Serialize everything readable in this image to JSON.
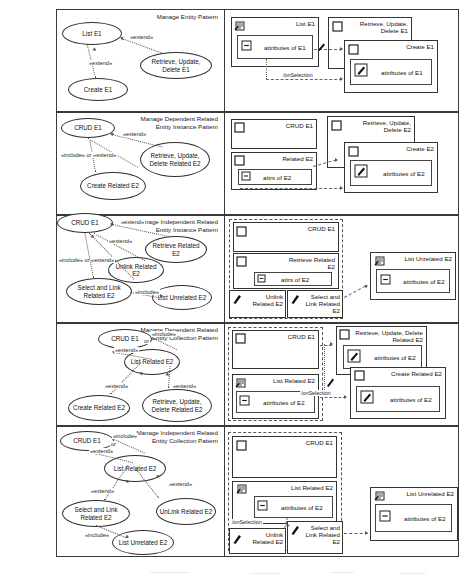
{
  "figure": {
    "rows": 5,
    "columns": [
      "use-case-diagram",
      "ui-navigation-diagram"
    ]
  },
  "rows": [
    {
      "id": "manage-entity-pattern",
      "caption_line1": "Manage Entity Pattern",
      "caption_line2": "",
      "usecases": [
        {
          "name": "list-e1",
          "label": "List E1"
        },
        {
          "name": "retrieve-update-delete-e1",
          "label": "Retrieve, Update, Delete E1"
        },
        {
          "name": "create-e1",
          "label": "Create E1"
        }
      ],
      "relations": [
        {
          "name": "extend-retrieve-to-list",
          "label": "«extend»"
        },
        {
          "name": "extend-create-to-list",
          "label": "«extend»"
        }
      ],
      "windows": [
        {
          "name": "list-e1-window",
          "title": "List E1",
          "icon": "list-icon",
          "inner": [
            {
              "name": "attributes-of-e1-field",
              "label": "attributes of E1",
              "icon": "collapse-icon"
            }
          ]
        },
        {
          "name": "retrieve-update-delete-e1-window",
          "title": "Retrieve, Update, Delete E1",
          "icon": "checkbox-icon",
          "inner": []
        },
        {
          "name": "create-e1-window",
          "title": "Create E1",
          "icon": "checkbox-icon",
          "inner": [
            {
              "name": "attributes-of-e1-field",
              "label": "attributes of E1",
              "icon": "edit-icon"
            }
          ]
        }
      ],
      "flows": [
        {
          "name": "onselection-flow",
          "label": "/onSelection"
        }
      ]
    },
    {
      "id": "manage-dependent-related-entity-instance-pattern",
      "caption_line1": "Manage Dependent Related",
      "caption_line2": "Entity Instance Pattern",
      "usecases": [
        {
          "name": "crud-e1",
          "label": "CRUD E1"
        },
        {
          "name": "retrieve-update-delete-related-e2",
          "label": "Retrieve, Update, Delete Related E2"
        },
        {
          "name": "create-related-e2",
          "label": "Create Related E2"
        }
      ],
      "relations": [
        {
          "name": "extend-rud-to-crud",
          "label": "«extend»"
        },
        {
          "name": "include-or-extend",
          "label": "«include» or «extend»"
        }
      ],
      "windows": [
        {
          "name": "crud-e1-window",
          "title": "CRUD E1",
          "icon": "checkbox-icon",
          "inner": []
        },
        {
          "name": "related-e2-window",
          "title": "Related E2",
          "icon": "checkbox-icon",
          "inner": [
            {
              "name": "attrs-of-e2-field",
              "label": "attrs of E2",
              "icon": "collapse-icon"
            }
          ]
        },
        {
          "name": "retrieve-update-delete-e2-window",
          "title": "Retrieve, Update, Delete E2",
          "icon": "checkbox-icon",
          "inner": []
        },
        {
          "name": "create-e2-window",
          "title": "Create E2",
          "icon": "checkbox-icon",
          "inner": [
            {
              "name": "attributes-of-e2-field",
              "label": "attributes of E2",
              "icon": "edit-icon"
            }
          ]
        }
      ],
      "flows": []
    },
    {
      "id": "manage-independent-related-entity-instance-pattern",
      "caption_line1": "Manage Independent Related",
      "caption_line2": "Entity Instance Pattern",
      "usecases": [
        {
          "name": "crud-e1",
          "label": "CRUD E1"
        },
        {
          "name": "retrieve-related-e2",
          "label": "Retrieve Related E2"
        },
        {
          "name": "unlink-related-e2",
          "label": "Unlink Related E2"
        },
        {
          "name": "select-and-link-related-e2",
          "label": "Select and Link Related E2"
        },
        {
          "name": "list-unrelated-e2",
          "label": "List Unrelated E2"
        }
      ],
      "relations": [
        {
          "name": "extend-retrieve",
          "label": "«extend»"
        },
        {
          "name": "extend-unlink",
          "label": "«extend»"
        },
        {
          "name": "include-or-extend",
          "label": "«include» or «extend»"
        },
        {
          "name": "include-list-unrelated",
          "label": "«include»"
        }
      ],
      "windows": [
        {
          "name": "crud-e1-window",
          "title": "CRUD E1",
          "icon": "checkbox-icon",
          "inner": []
        },
        {
          "name": "retrieve-related-e2-window",
          "title": "Retrieve Related E2",
          "icon": "checkbox-icon",
          "inner": [
            {
              "name": "attrs-of-e2-field",
              "label": "attrs of E2",
              "icon": "collapse-icon"
            }
          ]
        },
        {
          "name": "unlink-related-e2-window",
          "title": "Unlink Related E2",
          "icon": "edit-icon",
          "inner": []
        },
        {
          "name": "select-and-link-related-e2-window",
          "title": "Select and Link Related E2",
          "icon": "edit-icon",
          "inner": []
        },
        {
          "name": "list-unrelated-e2-window",
          "title": "List Unrelated E2",
          "icon": "list-icon",
          "inner": [
            {
              "name": "attributes-of-e2-field",
              "label": "attributes of E2",
              "icon": "collapse-icon"
            }
          ]
        }
      ],
      "flows": []
    },
    {
      "id": "manage-dependent-related-entity-collection-pattern",
      "caption_line1": "Manage Dependent Related",
      "caption_line2": "Entity Collection Pattern",
      "usecases": [
        {
          "name": "crud-e1",
          "label": "CRUD E1"
        },
        {
          "name": "list-related-e2",
          "label": "List Related E2"
        },
        {
          "name": "create-related-e2",
          "label": "Create Related E2"
        },
        {
          "name": "retrieve-update-delete-related-e2",
          "label": "Retrieve, Update, Delete Related E2"
        }
      ],
      "relations": [
        {
          "name": "include-or",
          "label": "«include» or"
        },
        {
          "name": "extend-crud-to-list",
          "label": "«extend»"
        },
        {
          "name": "extend-create",
          "label": "«extend»"
        },
        {
          "name": "extend-rud",
          "label": "«extend»"
        }
      ],
      "windows": [
        {
          "name": "crud-e1-window",
          "title": "CRUD E1",
          "icon": "checkbox-icon",
          "inner": []
        },
        {
          "name": "list-related-e2-window",
          "title": "List Related E2",
          "icon": "list-icon",
          "inner": [
            {
              "name": "attributes-of-e2-field",
              "label": "attributes of E2",
              "icon": "collapse-icon"
            }
          ]
        },
        {
          "name": "retrieve-update-delete-related-e2-window",
          "title": "Retrieve, Update, Delete Related E2",
          "icon": "checkbox-icon",
          "inner": [
            {
              "name": "attributes-of-e2-field",
              "label": "attributes of E2",
              "icon": "edit-icon"
            }
          ]
        },
        {
          "name": "create-related-e2-window",
          "title": "Create Related E2",
          "icon": "checkbox-icon",
          "inner": [
            {
              "name": "attributes-of-e2-field",
              "label": "attributes of E2",
              "icon": "edit-icon"
            }
          ]
        }
      ],
      "flows": [
        {
          "name": "onselection-flow",
          "label": "/onSelection"
        }
      ]
    },
    {
      "id": "manage-independent-related-entity-collection-pattern",
      "caption_line1": "Manage Independent Related",
      "caption_line2": "Entity Collection Pattern",
      "usecases": [
        {
          "name": "crud-e1",
          "label": "CRUD E1"
        },
        {
          "name": "list-related-e2",
          "label": "List Related E2"
        },
        {
          "name": "select-and-link-related-e2",
          "label": "Select and Link Related E2"
        },
        {
          "name": "unlink-related-e2",
          "label": "UnLink Related E2"
        },
        {
          "name": "list-unrelated-e2",
          "label": "List Unrelated E2"
        }
      ],
      "relations": [
        {
          "name": "include-or",
          "label": "«include» or"
        },
        {
          "name": "extend-crud-to-list",
          "label": "«extend»"
        },
        {
          "name": "extend-select-and-link",
          "label": "«extend»"
        },
        {
          "name": "extend-unlink",
          "label": "«extend»"
        },
        {
          "name": "include-list-unrelated",
          "label": "«include»"
        }
      ],
      "windows": [
        {
          "name": "crud-e1-window",
          "title": "CRUD E1",
          "icon": "checkbox-icon",
          "inner": []
        },
        {
          "name": "list-related-e2-window",
          "title": "List Related E2",
          "icon": "list-icon",
          "inner": [
            {
              "name": "attributes-of-e2-field",
              "label": "attributes of E2",
              "icon": "collapse-icon"
            }
          ]
        },
        {
          "name": "unlink-related-e2-window",
          "title": "Unlink Related E2",
          "icon": "edit-icon",
          "inner": []
        },
        {
          "name": "select-and-link-related-e2-window",
          "title": "Select and Link Related E2",
          "icon": "edit-icon",
          "inner": []
        },
        {
          "name": "list-unrelated-e2-window",
          "title": "List Unrelated E2",
          "icon": "list-icon",
          "inner": [
            {
              "name": "attributes-of-e2-field",
              "label": "attributes of E2",
              "icon": "collapse-icon"
            }
          ]
        }
      ],
      "flows": [
        {
          "name": "onselection-flow",
          "label": "/onSelection"
        }
      ]
    }
  ],
  "labels": {
    "extend": "«extend»",
    "include": "«include»",
    "include_or_extend": "«include» or «extend»",
    "include_or": "«include» or",
    "or": "or",
    "onselection": "/onSelection",
    "attrs_of_e2": "attrs of E2",
    "attributes_of_e1": "attributes of E1",
    "attributes_of_e2": "attributes of E2",
    "list_e1": "List E1",
    "create_e1": "Create E1",
    "crud_e1": "CRUD E1",
    "create_e2": "Create E2",
    "related_e2": "Related E2"
  },
  "colors": {
    "ink": "#2e2e2e",
    "paper": "#ffffff",
    "dash": "#555555"
  }
}
